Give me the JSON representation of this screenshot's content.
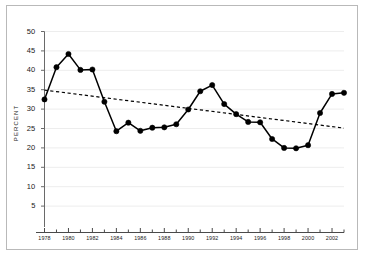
{
  "chart_data": {
    "type": "line",
    "title": "",
    "subtitle": "",
    "xlabel": "",
    "ylabel": "PERCENT",
    "xlim": [
      1978,
      2003
    ],
    "ylim": [
      0,
      50
    ],
    "yticks": [
      5,
      10,
      15,
      20,
      25,
      30,
      35,
      40,
      45,
      50
    ],
    "xticks": [
      1978,
      1980,
      1982,
      1984,
      1986,
      1988,
      1990,
      1992,
      1994,
      1996,
      1998,
      2000,
      2002
    ],
    "xtick_labels": [
      "1978",
      "1980",
      "1982",
      "1984",
      "1986",
      "1988",
      "1990",
      "1992",
      "1994",
      "1996",
      "1998",
      "2000",
      "2002"
    ],
    "grid": true,
    "legend": "none",
    "x": [
      1978,
      1979,
      1980,
      1981,
      1982,
      1983,
      1984,
      1985,
      1986,
      1987,
      1988,
      1989,
      1990,
      1991,
      1992,
      1993,
      1994,
      1995,
      1996,
      1997,
      1998,
      1999,
      2000,
      2001,
      2002,
      2003
    ],
    "series": [
      {
        "name": "Percent",
        "style": "solid-with-markers",
        "color": "#000000",
        "values": [
          32.5,
          40.8,
          44.2,
          40.1,
          40.2,
          31.9,
          24.3,
          26.5,
          24.4,
          25.2,
          25.3,
          26.1,
          29.9,
          34.6,
          36.2,
          31.3,
          28.7,
          26.7,
          26.6,
          22.3,
          20.0,
          19.9,
          20.7,
          29.0,
          33.9,
          34.2
        ]
      },
      {
        "name": "Trend",
        "style": "dashed",
        "color": "#000000",
        "endpoints": [
          [
            1978,
            34.9
          ],
          [
            2003,
            25.1
          ]
        ]
      }
    ]
  },
  "axis": {
    "ytick_labels": [
      "50",
      "45",
      "40",
      "35",
      "30",
      "25",
      "20",
      "15",
      "10",
      "5"
    ],
    "ylabel_text": "PERCENT"
  }
}
